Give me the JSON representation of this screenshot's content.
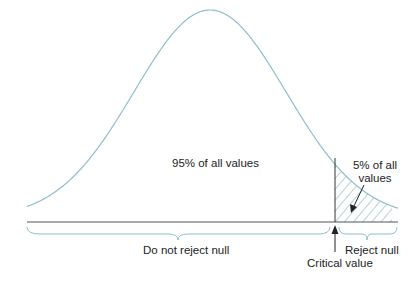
{
  "diagram": {
    "type": "normal-distribution-one-tailed-test",
    "colors": {
      "curve": "#8fbfc9",
      "baseline": "#555555",
      "critical_line": "#333333",
      "hatch": "#6fa3b0",
      "brace": "#8fbfc9",
      "text": "#222222"
    },
    "labels": {
      "main_region": "95% of all values",
      "tail_region_line1": "5% of all",
      "tail_region_line2": "values",
      "do_not_reject": "Do not reject null",
      "reject": "Reject null",
      "critical_value": "Critical value"
    },
    "geometry": {
      "peak_x": 210,
      "peak_y": 14,
      "baseline_y": 222,
      "sigma_px": 76,
      "x_start": 27,
      "x_end": 398,
      "critical_x": 335,
      "critical_top_y": 158
    }
  }
}
